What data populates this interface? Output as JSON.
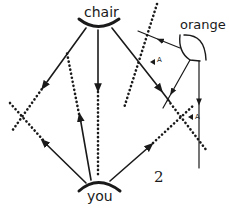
{
  "diagram": {
    "labels": {
      "chair": "chair",
      "you": "you",
      "orange": "orange",
      "marker_a_upper": "A",
      "marker_a_lower": "A",
      "figure_number": "2"
    },
    "nodes": [
      {
        "id": "chair",
        "label": "chair",
        "shape": "arc"
      },
      {
        "id": "you",
        "label": "you",
        "shape": "arc"
      },
      {
        "id": "orange",
        "label": "orange",
        "shape": "arc"
      }
    ],
    "edges": [
      {
        "from": "chair",
        "direction": "down-left",
        "style": "solid",
        "continues": "dotted"
      },
      {
        "from": "chair",
        "direction": "down",
        "style": "solid",
        "continues": "dotted"
      },
      {
        "from": "chair",
        "direction": "down-right",
        "style": "solid"
      },
      {
        "from": "you",
        "direction": "up-left",
        "style": "solid",
        "continues": "dotted"
      },
      {
        "from": "you",
        "direction": "up",
        "style": "solid",
        "continues": "dotted"
      },
      {
        "from": "you",
        "direction": "up-right",
        "style": "solid",
        "continues": "dotted"
      },
      {
        "from": "orange",
        "direction": "up-left",
        "style": "solid"
      },
      {
        "from": "orange",
        "direction": "down-left",
        "style": "solid"
      },
      {
        "from": "orange",
        "direction": "down",
        "style": "solid"
      }
    ],
    "colors": {
      "stroke": "#1a1a1a",
      "background": "#ffffff"
    }
  }
}
